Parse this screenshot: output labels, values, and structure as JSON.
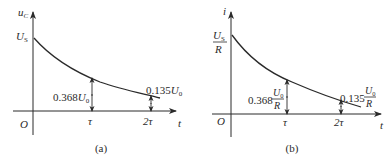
{
  "panels": [
    {
      "id": "a",
      "caption": "(a)",
      "y_axis_label": "u",
      "y_axis_sub": "C",
      "x_axis_label": "t",
      "origin_label": "O",
      "y_start_label": "U",
      "y_start_sub": "S",
      "tick_tau": "τ",
      "tick_2tau": "2τ",
      "ann_tau_coef": "0.368",
      "ann_tau_var": "U",
      "ann_tau_sub": "0",
      "ann_2tau_coef": "0.135",
      "ann_2tau_var": "U",
      "ann_2tau_sub": "0"
    },
    {
      "id": "b",
      "caption": "(b)",
      "y_axis_label": "i",
      "x_axis_label": "t",
      "origin_label": "O",
      "y_start_num": "U",
      "y_start_num_sub": "S",
      "y_start_den": "R",
      "tick_tau": "τ",
      "tick_2tau": "2τ",
      "ann_tau_coef": "0.368",
      "ann_tau_num": "U",
      "ann_tau_num_sub": "0",
      "ann_tau_den": "R",
      "ann_2tau_coef": "0.135",
      "ann_2tau_num": "U",
      "ann_2tau_num_sub": "0",
      "ann_2tau_den": "R"
    }
  ],
  "colors": {
    "stroke": "#2a2a2a",
    "background": "#ffffff"
  }
}
